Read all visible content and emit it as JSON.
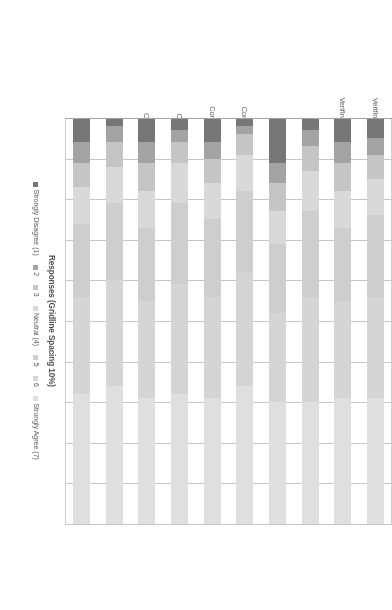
{
  "chart_data": {
    "type": "bar",
    "subtype": "stacked-horizontal-likert",
    "title": "",
    "xlabel": "Responses (Gridline Spacing 10%)",
    "ylabel": "",
    "grid": true,
    "gridline_spacing_percent": 10,
    "xlim": [
      0,
      100
    ],
    "legend_position": "bottom",
    "orientation": "horizontal-bars, figure rotated 90 degrees",
    "categories": [
      "VerifIncreasesConfidence(2011)",
      "VerifIncreasesConfidence(2009)",
      "UnderstandVerify(2011)",
      "UnderstandVerify(2009)",
      "ConfidenceVotePrivate(2011)",
      "ConfidenceVotePrivate(2009)",
      "ConfidenceInResults(2011)",
      "ConfidenceInResults(2009)",
      "EasyToUse(2011)",
      "EasyToUse(2009)"
    ],
    "series": [
      {
        "name": "Strongly Disagree (1)",
        "color": "#6b6b6b",
        "values": [
          5,
          6,
          3,
          11,
          2,
          6,
          3,
          6,
          2,
          6
        ]
      },
      {
        "name": "2",
        "color": "#9b9b9b",
        "values": [
          4,
          5,
          4,
          5,
          2,
          4,
          3,
          5,
          4,
          5
        ]
      },
      {
        "name": "3",
        "color": "#c0c0c0",
        "values": [
          6,
          7,
          6,
          7,
          5,
          6,
          5,
          7,
          6,
          6
        ]
      },
      {
        "name": "Neutral (4)",
        "color": "#d6d6d6",
        "values": [
          9,
          9,
          10,
          8,
          9,
          9,
          10,
          9,
          9,
          9
        ]
      },
      {
        "name": "5",
        "color": "#cacaca",
        "values": [
          20,
          18,
          21,
          17,
          20,
          19,
          20,
          18,
          19,
          18
        ]
      },
      {
        "name": "6",
        "color": "#d2d2d2",
        "values": [
          25,
          24,
          26,
          22,
          28,
          25,
          27,
          24,
          26,
          24
        ]
      },
      {
        "name": "Strongly Agree (7)",
        "color": "#dcdcdc",
        "values": [
          31,
          31,
          30,
          30,
          34,
          31,
          32,
          31,
          34,
          32
        ]
      }
    ],
    "legend_entries": [
      "Strongly Disagree (1)",
      "2",
      "3",
      "Neutral (4)",
      "5",
      "6",
      "Strongly Agree (7)"
    ],
    "gridline_values": [
      10,
      20,
      30,
      40,
      50,
      60,
      70,
      80,
      90,
      100
    ]
  },
  "colors": {
    "axis": "#9a9a9a",
    "grid": "#c2c2c2",
    "text": "#4a4a4a",
    "background": "#ffffff"
  }
}
